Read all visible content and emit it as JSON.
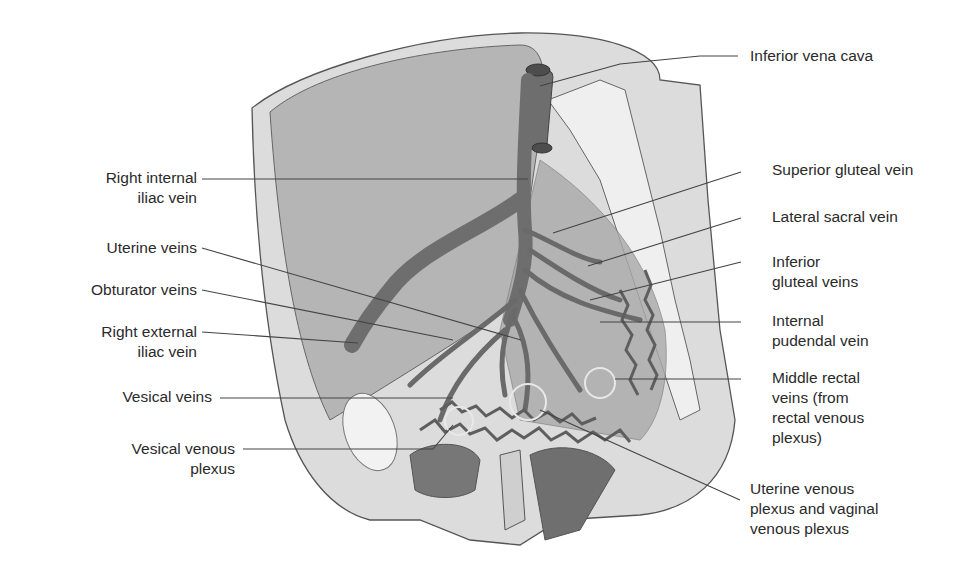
{
  "figure": {
    "colors": {
      "vein": "#6e6e6e",
      "vein_dark": "#4d4d4d",
      "tissue_light": "#d6d6d6",
      "tissue_mid": "#b9b9b9",
      "bone": "#eeeeee",
      "organ": "#7a7a7a",
      "leader": "#444444",
      "text": "#2a2a2a"
    }
  },
  "labels_left": [
    {
      "id": "right-internal-iliac-vein",
      "text": "Right internal\niliac vein"
    },
    {
      "id": "uterine-veins",
      "text": "Uterine veins"
    },
    {
      "id": "obturator-veins",
      "text": "Obturator veins"
    },
    {
      "id": "right-external-iliac-vein",
      "text": "Right external\niliac vein"
    },
    {
      "id": "vesical-veins",
      "text": "Vesical veins"
    },
    {
      "id": "vesical-venous-plexus",
      "text": "Vesical venous\nplexus"
    }
  ],
  "labels_right": [
    {
      "id": "inferior-vena-cava",
      "text": "Inferior vena cava"
    },
    {
      "id": "superior-gluteal-vein",
      "text": "Superior gluteal vein"
    },
    {
      "id": "lateral-sacral-vein",
      "text": "Lateral sacral vein"
    },
    {
      "id": "inferior-gluteal-veins",
      "text": "Inferior\ngluteal veins"
    },
    {
      "id": "internal-pudendal-vein",
      "text": "Internal\npudendal vein"
    },
    {
      "id": "middle-rectal-veins",
      "text": "Middle rectal\nveins (from\nrectal venous\nplexus)"
    },
    {
      "id": "uterine-vaginal-venous-plexus",
      "text": "Uterine venous\nplexus and vaginal\nvenous plexus"
    }
  ]
}
